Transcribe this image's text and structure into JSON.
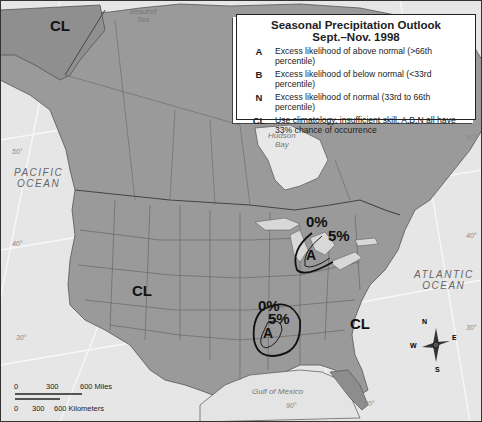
{
  "legend": {
    "title_line1": "Seasonal Precipitation Outlook",
    "title_line2": "Sept.–Nov. 1998",
    "entries": [
      {
        "key": "A",
        "description": "Excess likelihood of above normal (>66th percentile)"
      },
      {
        "key": "B",
        "description": "Excess likelihood of below normal (<33rd percentile)"
      },
      {
        "key": "N",
        "description": "Excess likelihood of normal (33rd to 66th percentile)"
      },
      {
        "key": "CL",
        "description": "Use climatology, insufficient skill, A,B,N all have 33% chance of occurrence"
      }
    ]
  },
  "map_labels": {
    "pacific_line1": "PACIFIC",
    "pacific_line2": "OCEAN",
    "atlantic_line1": "ATLANTIC",
    "atlantic_line2": "OCEAN",
    "gulf": "Gulf of Mexico",
    "hudson_line1": "Hudson",
    "hudson_line2": "Bay",
    "beaufort_line1": "Beaufort",
    "beaufort_line2": "Sea"
  },
  "zones": {
    "alaska": "CL",
    "west": "CL",
    "east": "CL",
    "great_lakes": {
      "label": "A",
      "outer_pct": "0%",
      "inner_pct": "5%"
    },
    "south_central": {
      "label": "A",
      "outer_pct": "0%",
      "inner_pct": "5%"
    }
  },
  "graticule": {
    "lat_50_left": "50°",
    "lat_40_left": "40°",
    "lat_30_left": "30°",
    "lat_50_right": "50°",
    "lat_40_right": "40°",
    "lat_30_right": "30°",
    "lon_90": "90°",
    "lon_80": "80°"
  },
  "scale_bar": {
    "miles": [
      "0",
      "300",
      "600 Miles"
    ],
    "km": [
      "0",
      "300",
      "600 Kilometers"
    ]
  },
  "compass": {
    "n": "N",
    "s": "S",
    "e": "E",
    "w": "W"
  }
}
